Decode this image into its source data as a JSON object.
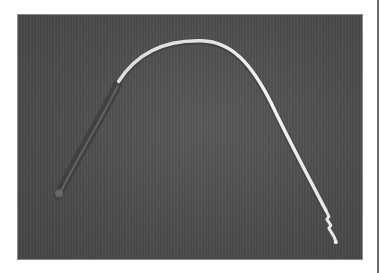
{
  "image": {
    "subject": "curved metal probe with plug tip",
    "colors": {
      "background": "#ffffff",
      "photo_backdrop": "#505050",
      "probe_highlight": "#f2f2f2",
      "probe_shadow": "#3a3a3a",
      "frame_border": "#8a8a8a",
      "edge_line": "#6a6a6a"
    }
  }
}
